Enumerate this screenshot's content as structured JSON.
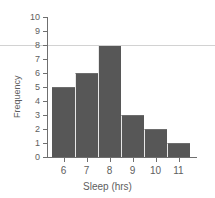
{
  "chart_data": {
    "type": "bar",
    "title": "",
    "subtitle": "",
    "xlabel": "Sleep (hrs)",
    "ylabel": "Frequency",
    "categories": [
      "6",
      "7",
      "8",
      "9",
      "10",
      "11"
    ],
    "values": [
      5,
      6,
      8,
      3,
      2,
      1
    ],
    "series": [
      {
        "name": "Frequency",
        "values": [
          5,
          6,
          8,
          3,
          2,
          1
        ]
      }
    ],
    "xlim": [
      5.5,
      11.5
    ],
    "ylim": [
      0,
      10
    ],
    "y_ticks": [
      "0",
      "1",
      "2",
      "3",
      "4",
      "5",
      "6",
      "7",
      "8",
      "9",
      "10"
    ],
    "x_ticks": [
      "6",
      "7",
      "8",
      "9",
      "10",
      "11"
    ],
    "grid": false,
    "legend": null,
    "legend_position": "none",
    "annotations": [],
    "bar_color": "#575757",
    "axis_color": "#6f6f6f",
    "text_color": "#5e5e5e",
    "background_color": "#ffffff",
    "stray_rule_color": "#d2d2d2",
    "stray_rule_at_y": 8
  }
}
